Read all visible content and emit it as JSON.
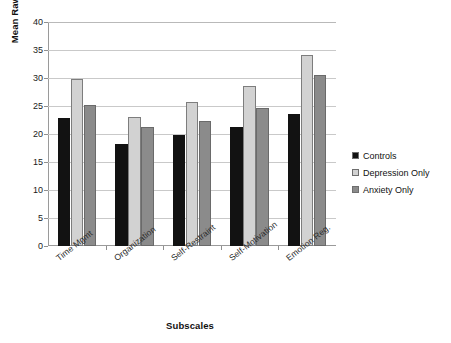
{
  "chart_data": {
    "type": "bar",
    "title": "",
    "xlabel": "Subscales",
    "ylabel": "Mean Raw Scores",
    "ylim": [
      0,
      40
    ],
    "ytick_step": 5,
    "yticks": [
      40,
      35,
      30,
      25,
      20,
      15,
      10,
      5,
      0
    ],
    "grid": true,
    "legend_position": "right",
    "categories": [
      "Time Mgmt",
      "Organization",
      "Self-Restraint",
      "Self-Motivation",
      "Emotion Reg."
    ],
    "series": [
      {
        "name": "Controls",
        "color": "#121212",
        "values": [
          22.8,
          18.3,
          19.8,
          21.3,
          23.5
        ]
      },
      {
        "name": "Depression Only",
        "color": "#d2d2d2",
        "values": [
          29.8,
          23.0,
          25.8,
          28.5,
          34.1
        ]
      },
      {
        "name": "Anxiety Only",
        "color": "#8b8b8b",
        "values": [
          25.1,
          21.2,
          22.3,
          24.7,
          30.6
        ]
      }
    ]
  },
  "legend": {
    "items": [
      {
        "label": "Controls",
        "color": "#121212"
      },
      {
        "label": "Depression Only",
        "color": "#d2d2d2"
      },
      {
        "label": "Anxiety Only",
        "color": "#8b8b8b"
      }
    ]
  }
}
